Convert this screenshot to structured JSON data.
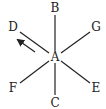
{
  "diagram": {
    "type": "star of lines from a central point",
    "center": {
      "label": "A",
      "x": 55,
      "y": 57
    },
    "points": [
      {
        "label": "B",
        "x": 55,
        "y": 10,
        "lx": 55,
        "ly": 12
      },
      {
        "label": "C",
        "x": 55,
        "y": 104,
        "lx": 55,
        "ly": 106
      },
      {
        "label": "D",
        "x": 13,
        "y": 28,
        "lx": 13,
        "ly": 31
      },
      {
        "label": "E",
        "x": 96,
        "y": 88,
        "lx": 96,
        "ly": 92
      },
      {
        "label": "F",
        "x": 13,
        "y": 88,
        "lx": 13,
        "ly": 92
      },
      {
        "label": "G",
        "x": 96,
        "y": 28,
        "lx": 96,
        "ly": 31
      }
    ],
    "arrow": {
      "direction": "toward D",
      "from": [
        35,
        52
      ],
      "to": [
        17,
        39
      ]
    },
    "colors": {
      "stroke": "#222222",
      "background": "#ffffff"
    }
  }
}
